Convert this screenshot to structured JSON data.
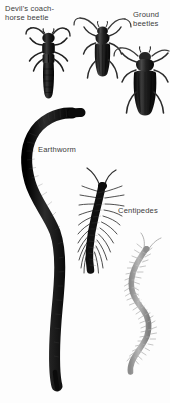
{
  "plate": {
    "kind": "natural-history-photo-plate",
    "subject": "soil invertebrates",
    "background_color": "#fdfdfd",
    "width": 170,
    "height": 403
  },
  "labels": {
    "devil_beetle": "Devil's coach-\nhorse beetle",
    "ground_beetles": "Ground\nbeetles",
    "earthworm": "Earthworm",
    "centipedes": "Centipedes"
  },
  "specimens": [
    {
      "name": "devils-coach-horse-beetle",
      "color": "#1d1d1d"
    },
    {
      "name": "ground-beetle-center",
      "color": "#2a2a2a"
    },
    {
      "name": "ground-beetle-right",
      "color": "#161616"
    },
    {
      "name": "earthworm",
      "color": "#111111"
    },
    {
      "name": "centipede-dark",
      "color": "#1a1a1a"
    },
    {
      "name": "centipede-grey",
      "color": "#9a9a9a"
    }
  ],
  "text_color": "#3c3c3c"
}
